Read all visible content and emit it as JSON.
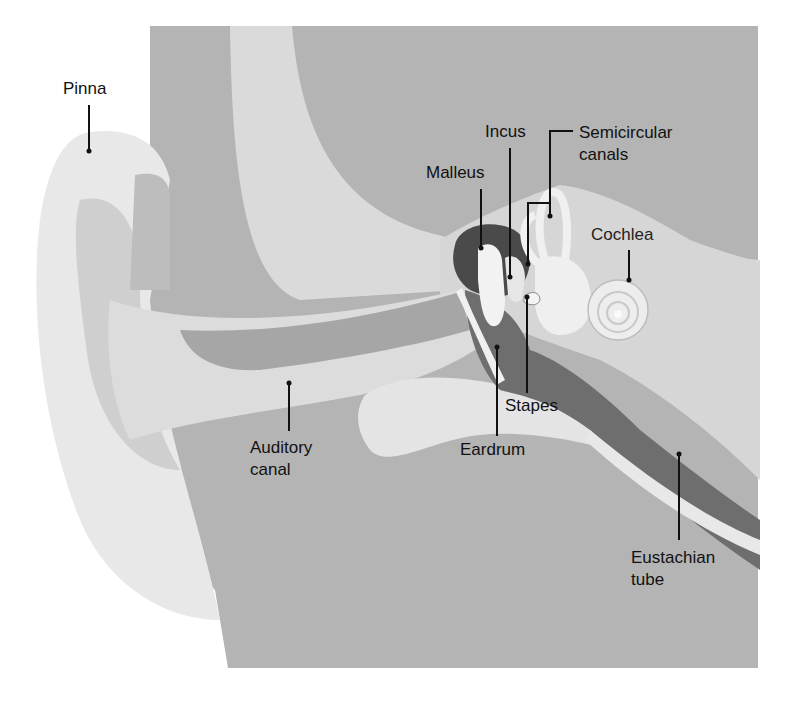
{
  "diagram": {
    "colors": {
      "background": "#ffffff",
      "head_gray": "#b4b4b4",
      "mid_gray": "#c8c8c8",
      "light_tissue": "#e6e6e6",
      "canal_dark": "#7a7a7a",
      "ossicle_dark": "#4a4a4a",
      "label_text": "#111111"
    },
    "labels": {
      "pinna": "Pinna",
      "incus": "Incus",
      "malleus": "Malleus",
      "semicircular_canals": "Semicircular\ncanals",
      "cochlea": "Cochlea",
      "stapes": "Stapes",
      "auditory_canal": "Auditory\ncanal",
      "eardrum": "Eardrum",
      "eustachian_tube": "Eustachian\ntube"
    }
  }
}
